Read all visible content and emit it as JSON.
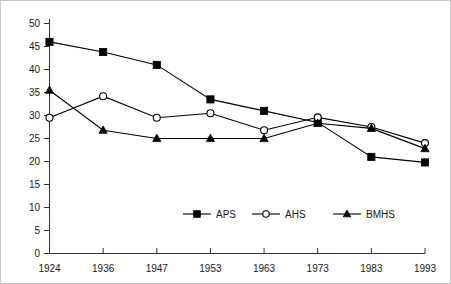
{
  "chart_data": {
    "type": "line",
    "title": "",
    "subtitle": "",
    "xlabel": "",
    "ylabel": "",
    "categories": [
      "1924",
      "1936",
      "1947",
      "1953",
      "1963",
      "1973",
      "1983",
      "1993"
    ],
    "x_tick_labels": [
      "1924",
      "1936",
      "1947",
      "1953",
      "1963",
      "1973",
      "1983",
      "1993"
    ],
    "y_tick_labels": [
      "0",
      "5",
      "10",
      "15",
      "20",
      "25",
      "30",
      "35",
      "40",
      "45",
      "50"
    ],
    "y_ticks": [
      0,
      5,
      10,
      15,
      20,
      25,
      30,
      35,
      40,
      45,
      50
    ],
    "ylim": [
      0,
      50
    ],
    "grid": false,
    "legend_position": "inside-bottom-center",
    "series": [
      {
        "name": "APS",
        "marker": "filled-square",
        "color": "#000000",
        "values": [
          46.0,
          43.8,
          41.0,
          33.5,
          31.0,
          28.5,
          21.0,
          19.8
        ]
      },
      {
        "name": "AHS",
        "marker": "open-circle",
        "color": "#000000",
        "values": [
          29.5,
          34.2,
          29.5,
          30.5,
          26.8,
          29.6,
          27.5,
          24.0
        ]
      },
      {
        "name": "BMHS",
        "marker": "filled-triangle",
        "color": "#000000",
        "values": [
          35.5,
          26.8,
          25.0,
          25.0,
          25.0,
          28.3,
          27.2,
          22.8
        ]
      }
    ],
    "legend": [
      {
        "label": "APS",
        "marker": "filled-square"
      },
      {
        "label": "AHS",
        "marker": "open-circle"
      },
      {
        "label": "BMHS",
        "marker": "filled-triangle"
      }
    ]
  }
}
